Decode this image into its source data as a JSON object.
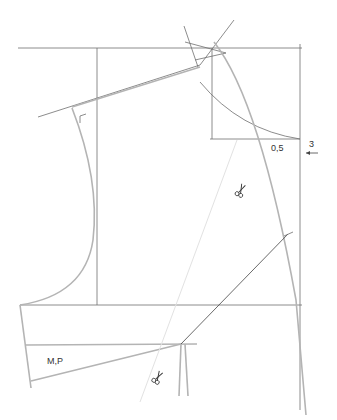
{
  "diagram": {
    "type": "sewing-pattern-draft",
    "labels": {
      "measurement_half": "0,5",
      "measurement_shift": "3",
      "piece_label": "M,P"
    },
    "icons": {
      "scissors_upper": "scissors-icon",
      "scissors_lower": "scissors-icon",
      "shift_arrow": "arrow-left-icon",
      "right_angle_mark": "right-angle-icon"
    },
    "colors": {
      "construction_line": "#6e6e6e",
      "pattern_line": "#b4b4b4",
      "guide_line": "#e2e2e2",
      "text": "#333333"
    }
  }
}
